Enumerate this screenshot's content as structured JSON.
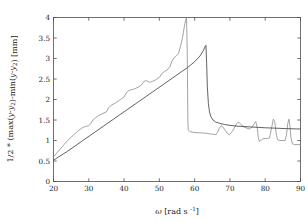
{
  "chart_data": {
    "type": "line",
    "title": "",
    "xlabel": "ω [rad s⁻¹]",
    "ylabel": "1/2 * (max(y-y₂)-min(y-y₂)) [mm]",
    "xlim": [
      20,
      90
    ],
    "ylim": [
      0,
      4
    ],
    "xticks": [
      20,
      30,
      40,
      50,
      60,
      70,
      80,
      90
    ],
    "xticklabels": [
      "20",
      "30",
      "40",
      "50",
      "60",
      "70",
      "80",
      "90"
    ],
    "yticks": [
      0,
      0.5,
      1,
      1.5,
      2,
      2.5,
      3,
      3.5,
      4
    ],
    "yticklabels": [
      "0",
      "0.5",
      "1",
      "1.5",
      "2",
      "2.5",
      "3",
      "3.5",
      "4"
    ],
    "grid": false,
    "legend": "none",
    "series": [
      {
        "name": "measured",
        "color": "#8c8c8c",
        "points": [
          [
            20.0,
            0.6
          ],
          [
            21.0,
            0.7
          ],
          [
            22.0,
            0.8
          ],
          [
            23.0,
            0.9
          ],
          [
            24.0,
            1.0
          ],
          [
            25.0,
            1.08
          ],
          [
            26.0,
            1.16
          ],
          [
            27.0,
            1.24
          ],
          [
            28.0,
            1.3
          ],
          [
            29.0,
            1.34
          ],
          [
            30.0,
            1.36
          ],
          [
            30.6,
            1.42
          ],
          [
            31.2,
            1.5
          ],
          [
            32.0,
            1.56
          ],
          [
            33.0,
            1.62
          ],
          [
            34.0,
            1.66
          ],
          [
            35.0,
            1.7
          ],
          [
            35.6,
            1.8
          ],
          [
            36.4,
            1.86
          ],
          [
            37.2,
            1.9
          ],
          [
            38.0,
            1.94
          ],
          [
            39.0,
            2.0
          ],
          [
            40.0,
            2.06
          ],
          [
            40.6,
            2.16
          ],
          [
            41.4,
            2.22
          ],
          [
            42.2,
            2.24
          ],
          [
            43.0,
            2.26
          ],
          [
            44.0,
            2.3
          ],
          [
            45.0,
            2.36
          ],
          [
            45.6,
            2.44
          ],
          [
            46.4,
            2.46
          ],
          [
            47.2,
            2.42
          ],
          [
            48.0,
            2.44
          ],
          [
            49.0,
            2.48
          ],
          [
            50.0,
            2.54
          ],
          [
            50.6,
            2.62
          ],
          [
            51.4,
            2.68
          ],
          [
            52.2,
            2.72
          ],
          [
            53.0,
            2.8
          ],
          [
            53.6,
            2.94
          ],
          [
            54.2,
            3.02
          ],
          [
            54.8,
            3.06
          ],
          [
            55.4,
            3.12
          ],
          [
            56.0,
            3.3
          ],
          [
            56.6,
            3.52
          ],
          [
            57.0,
            3.74
          ],
          [
            57.4,
            3.92
          ],
          [
            57.7,
            4.0
          ],
          [
            57.9,
            3.2
          ],
          [
            58.0,
            2.2
          ],
          [
            58.1,
            1.4
          ],
          [
            58.2,
            1.26
          ],
          [
            58.6,
            1.22
          ],
          [
            59.5,
            1.2
          ],
          [
            61.0,
            1.19
          ],
          [
            63.0,
            1.18
          ],
          [
            64.5,
            1.16
          ],
          [
            65.5,
            1.15
          ],
          [
            66.0,
            1.14
          ],
          [
            66.5,
            1.2
          ],
          [
            67.0,
            1.3
          ],
          [
            67.5,
            1.36
          ],
          [
            68.0,
            1.33
          ],
          [
            68.6,
            1.26
          ],
          [
            69.2,
            1.18
          ],
          [
            69.8,
            1.14
          ],
          [
            70.5,
            1.2
          ],
          [
            71.2,
            1.3
          ],
          [
            71.8,
            1.4
          ],
          [
            72.2,
            1.44
          ],
          [
            72.8,
            1.42
          ],
          [
            73.4,
            1.37
          ],
          [
            74.0,
            1.33
          ],
          [
            74.8,
            1.3
          ],
          [
            75.6,
            1.28
          ],
          [
            76.3,
            1.33
          ],
          [
            76.9,
            1.41
          ],
          [
            77.3,
            1.46
          ],
          [
            77.7,
            1.34
          ],
          [
            78.0,
            1.1
          ],
          [
            78.3,
            0.98
          ],
          [
            78.7,
            1.0
          ],
          [
            79.3,
            1.04
          ],
          [
            80.0,
            1.05
          ],
          [
            80.6,
            1.05
          ],
          [
            81.2,
            1.06
          ],
          [
            81.8,
            1.3
          ],
          [
            82.3,
            1.52
          ],
          [
            82.7,
            1.46
          ],
          [
            83.1,
            1.18
          ],
          [
            83.5,
            1.02
          ],
          [
            84.2,
            1.0
          ],
          [
            85.0,
            1.0
          ],
          [
            85.6,
            1.0
          ],
          [
            86.0,
            1.12
          ],
          [
            86.4,
            1.42
          ],
          [
            86.7,
            1.52
          ],
          [
            87.0,
            1.36
          ],
          [
            87.3,
            1.06
          ],
          [
            87.7,
            0.92
          ],
          [
            88.3,
            0.9
          ],
          [
            89.0,
            0.9
          ],
          [
            90.0,
            0.9
          ]
        ]
      },
      {
        "name": "simulated",
        "color": "#3a3a3a",
        "points": [
          [
            20.0,
            0.52
          ],
          [
            24.0,
            0.74
          ],
          [
            28.0,
            0.98
          ],
          [
            32.0,
            1.22
          ],
          [
            36.0,
            1.46
          ],
          [
            40.0,
            1.7
          ],
          [
            44.0,
            1.94
          ],
          [
            48.0,
            2.18
          ],
          [
            52.0,
            2.42
          ],
          [
            56.0,
            2.66
          ],
          [
            58.0,
            2.78
          ],
          [
            60.0,
            2.92
          ],
          [
            61.5,
            3.06
          ],
          [
            62.5,
            3.2
          ],
          [
            63.0,
            3.3
          ],
          [
            63.2,
            3.32
          ],
          [
            63.4,
            2.9
          ],
          [
            63.6,
            2.3
          ],
          [
            63.9,
            1.9
          ],
          [
            64.2,
            1.7
          ],
          [
            64.6,
            1.58
          ],
          [
            65.2,
            1.5
          ],
          [
            66.0,
            1.45
          ],
          [
            67.0,
            1.42
          ],
          [
            68.5,
            1.39
          ],
          [
            70.0,
            1.37
          ],
          [
            72.0,
            1.35
          ],
          [
            74.0,
            1.34
          ],
          [
            76.0,
            1.33
          ],
          [
            78.0,
            1.32
          ],
          [
            80.0,
            1.31
          ],
          [
            83.0,
            1.3
          ],
          [
            86.0,
            1.29
          ],
          [
            90.0,
            1.28
          ]
        ]
      }
    ]
  },
  "axes": {
    "x_label_omega": "ω",
    "x_label_units_open": "[rad s",
    "x_label_units_exp": "-1",
    "x_label_units_close": "]",
    "y_label_prefix": "1/2 * (max(",
    "y_label_y1": "y",
    "y_label_sub1": "2",
    "y_label_mid": ")-min(",
    "y_label_y2": "y",
    "y_label_sub2": "2",
    "y_label_suffix": ") [mm]"
  }
}
